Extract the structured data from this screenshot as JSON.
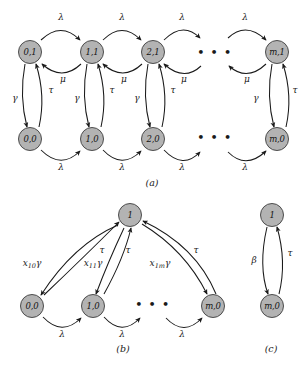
{
  "figure": {
    "node_fill": "#b3b3b3",
    "node_stroke": "#4d4d4d",
    "edge_color": "#1a1a1a",
    "background": "#ffffff"
  },
  "panels": [
    {
      "id": "a",
      "caption": "(a)",
      "nodes": [
        {
          "name": "a-node-0-1",
          "label": "0,1",
          "x": 30,
          "y": 52
        },
        {
          "name": "a-node-1-1",
          "label": "1,1",
          "x": 92,
          "y": 52
        },
        {
          "name": "a-node-2-1",
          "label": "2,1",
          "x": 153,
          "y": 52
        },
        {
          "name": "a-node-m-1",
          "label": "m,1",
          "x": 277,
          "y": 52
        },
        {
          "name": "a-node-0-0",
          "label": "0,0",
          "x": 30,
          "y": 139
        },
        {
          "name": "a-node-1-0",
          "label": "1,0",
          "x": 92,
          "y": 139
        },
        {
          "name": "a-node-2-0",
          "label": "2,0",
          "x": 153,
          "y": 139
        },
        {
          "name": "a-node-m-0",
          "label": "m,0",
          "x": 277,
          "y": 139
        }
      ],
      "ellipsis": [
        {
          "name": "a-ellipsis-top",
          "x": 215,
          "y": 52
        },
        {
          "name": "a-ellipsis-bottom",
          "x": 215,
          "y": 137
        }
      ],
      "edge_labels": [
        {
          "name": "a-lambda-top-1",
          "text": "λ",
          "x": 61,
          "y": 17
        },
        {
          "name": "a-lambda-top-2",
          "text": "λ",
          "x": 122,
          "y": 17
        },
        {
          "name": "a-lambda-top-3",
          "text": "λ",
          "x": 182,
          "y": 17
        },
        {
          "name": "a-lambda-top-4",
          "text": "λ",
          "x": 245,
          "y": 17
        },
        {
          "name": "a-mu-1",
          "text": "μ",
          "x": 63,
          "y": 79
        },
        {
          "name": "a-mu-2",
          "text": "μ",
          "x": 124,
          "y": 79
        },
        {
          "name": "a-mu-3",
          "text": "μ",
          "x": 184,
          "y": 79
        },
        {
          "name": "a-mu-4",
          "text": "μ",
          "x": 247,
          "y": 79
        },
        {
          "name": "a-gamma-1",
          "text": "γ",
          "x": 15,
          "y": 98
        },
        {
          "name": "a-tau-1",
          "text": "τ",
          "x": 51,
          "y": 90
        },
        {
          "name": "a-gamma-2",
          "text": "γ",
          "x": 77,
          "y": 98
        },
        {
          "name": "a-tau-2",
          "text": "τ",
          "x": 112,
          "y": 90
        },
        {
          "name": "a-gamma-3",
          "text": "γ",
          "x": 137,
          "y": 98
        },
        {
          "name": "a-tau-3",
          "text": "τ",
          "x": 173,
          "y": 90
        },
        {
          "name": "a-gamma-4",
          "text": "γ",
          "x": 256,
          "y": 98
        },
        {
          "name": "a-tau-4",
          "text": "τ",
          "x": 295,
          "y": 90
        },
        {
          "name": "a-lambda-bot-1",
          "text": "λ",
          "x": 61,
          "y": 167
        },
        {
          "name": "a-lambda-bot-2",
          "text": "λ",
          "x": 122,
          "y": 167
        },
        {
          "name": "a-lambda-bot-3",
          "text": "λ",
          "x": 182,
          "y": 167
        },
        {
          "name": "a-lambda-bot-4",
          "text": "λ",
          "x": 245,
          "y": 167
        }
      ],
      "caption_pos": {
        "x": 152,
        "y": 182
      }
    },
    {
      "id": "b",
      "caption": "(b)",
      "nodes": [
        {
          "name": "b-node-1",
          "label": "1",
          "x": 130,
          "y": 215
        },
        {
          "name": "b-node-0-0",
          "label": "0,0",
          "x": 32,
          "y": 306
        },
        {
          "name": "b-node-1-0",
          "label": "1,0",
          "x": 93,
          "y": 306
        },
        {
          "name": "b-node-m-0",
          "label": "m,0",
          "x": 213,
          "y": 306
        }
      ],
      "ellipsis": [
        {
          "name": "b-ellipsis",
          "x": 153,
          "y": 304
        }
      ],
      "edge_labels": [
        {
          "name": "b-x10gamma",
          "html": "x<span class='s'>10</span>γ",
          "x": 32,
          "y": 264
        },
        {
          "name": "b-x11gamma",
          "html": "x<span class='s'>11</span>γ",
          "x": 93,
          "y": 264
        },
        {
          "name": "b-x1mgamma",
          "html": "x<span class='s'>1m</span>γ",
          "x": 160,
          "y": 264
        },
        {
          "name": "b-tau-1",
          "text": "τ",
          "x": 102,
          "y": 250
        },
        {
          "name": "b-tau-2",
          "text": "τ",
          "x": 128,
          "y": 250
        },
        {
          "name": "b-tau-3",
          "text": "τ",
          "x": 196,
          "y": 250
        },
        {
          "name": "b-lambda-1",
          "text": "λ",
          "x": 62,
          "y": 334
        },
        {
          "name": "b-lambda-2",
          "text": "λ",
          "x": 122,
          "y": 334
        },
        {
          "name": "b-lambda-3",
          "text": "λ",
          "x": 182,
          "y": 334
        }
      ],
      "caption_pos": {
        "x": 123,
        "y": 348
      }
    },
    {
      "id": "c",
      "caption": "(c)",
      "nodes": [
        {
          "name": "c-node-1",
          "label": "1",
          "x": 272,
          "y": 215
        },
        {
          "name": "c-node-m-0",
          "label": "m,0",
          "x": 272,
          "y": 306
        }
      ],
      "ellipsis": [],
      "edge_labels": [
        {
          "name": "c-beta",
          "text": "β",
          "x": 254,
          "y": 260
        },
        {
          "name": "c-tau",
          "text": "τ",
          "x": 290,
          "y": 253
        }
      ],
      "caption_pos": {
        "x": 271,
        "y": 348
      }
    }
  ]
}
